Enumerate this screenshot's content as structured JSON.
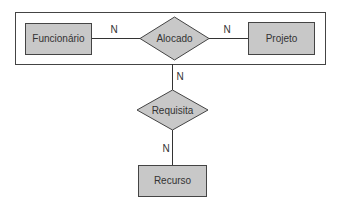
{
  "diagram": {
    "type": "entity-relationship",
    "colors": {
      "fill": "#c8c8c8",
      "stroke": "#333333",
      "background": "#ffffff"
    },
    "aggregation": {
      "name": "Alocado aggregation",
      "entities": [
        "Funcionário",
        "Projeto"
      ],
      "relationship": "Alocado"
    },
    "entities": [
      {
        "id": "funcionario",
        "label": "Funcionário"
      },
      {
        "id": "projeto",
        "label": "Projeto"
      },
      {
        "id": "recurso",
        "label": "Recurso"
      }
    ],
    "relationships": [
      {
        "id": "alocado",
        "label": "Alocado"
      },
      {
        "id": "requisita",
        "label": "Requisita"
      }
    ],
    "connections": [
      {
        "from": "Funcionário",
        "to": "Alocado",
        "cardinality": "N"
      },
      {
        "from": "Alocado",
        "to": "Projeto",
        "cardinality": "N"
      },
      {
        "from": "Aggregation (Alocado)",
        "to": "Requisita",
        "cardinality": "N"
      },
      {
        "from": "Requisita",
        "to": "Recurso",
        "cardinality": "N"
      }
    ]
  }
}
